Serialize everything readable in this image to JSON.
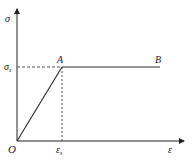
{
  "diagram": {
    "type": "stress-strain curve (elastic-perfectly plastic)",
    "y_axis": {
      "label": "σ"
    },
    "x_axis": {
      "label": "ε"
    },
    "origin": {
      "label": "O"
    },
    "yield_stress": {
      "label": "σ",
      "subscript": "s"
    },
    "yield_strain": {
      "label": "ε",
      "subscript": "s"
    },
    "points": [
      {
        "name": "A"
      },
      {
        "name": "B"
      }
    ],
    "colors": {
      "line": "#333333",
      "dashed": "#555555"
    }
  }
}
